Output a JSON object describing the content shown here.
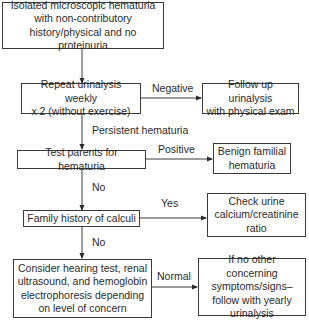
{
  "diagram": {
    "type": "flowchart",
    "nodes": [
      {
        "id": "start",
        "text": "Isolated microscopic hematuria\nwith non-contributory\nhistory/physical and no proteinuria"
      },
      {
        "id": "repeat",
        "text": "Repeat urinalysis weekly\nx 2 (without exercise)"
      },
      {
        "id": "followup",
        "text": "Follow up urinalysis\nwith physical exam"
      },
      {
        "id": "test_parents",
        "text": "Test parents for hematuria"
      },
      {
        "id": "benign",
        "text": "Benign familial\nhematuria"
      },
      {
        "id": "family_calculi",
        "text": "Family history of calculi"
      },
      {
        "id": "check_urine",
        "text": "Check urine\ncalcium/creatinine\nratio"
      },
      {
        "id": "consider",
        "text": "Consider hearing test, renal\nultrasound, and hemoglobin\nelectrophoresis depending\non level of concern"
      },
      {
        "id": "yearly",
        "text": "If no other concerning\nsymptoms/signs–\nfollow with yearly\nurinalysis"
      }
    ],
    "edges": [
      {
        "from": "start",
        "to": "repeat",
        "label": ""
      },
      {
        "from": "repeat",
        "to": "followup",
        "label": "Negative"
      },
      {
        "from": "repeat",
        "to": "test_parents",
        "label": "Persistent hematuria"
      },
      {
        "from": "test_parents",
        "to": "benign",
        "label": "Positive"
      },
      {
        "from": "test_parents",
        "to": "family_calculi",
        "label": "No"
      },
      {
        "from": "family_calculi",
        "to": "check_urine",
        "label": "Yes"
      },
      {
        "from": "family_calculi",
        "to": "consider",
        "label": "No"
      },
      {
        "from": "consider",
        "to": "yearly",
        "label": "Normal"
      }
    ]
  }
}
